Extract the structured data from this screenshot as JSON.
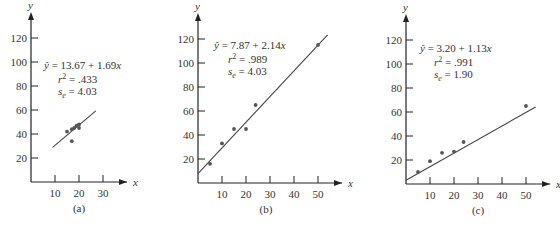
{
  "chart_data": [
    {
      "type": "scatter",
      "panel": "(a)",
      "xlabel": "x",
      "ylabel": "y",
      "xlim": [
        0,
        35
      ],
      "ylim": [
        0,
        130
      ],
      "x_ticks": [
        10,
        20,
        30
      ],
      "y_ticks": [
        20,
        40,
        60,
        80,
        100,
        120
      ],
      "grid": false,
      "points": [
        {
          "x": 15,
          "y": 42
        },
        {
          "x": 17,
          "y": 44
        },
        {
          "x": 18,
          "y": 45
        },
        {
          "x": 19,
          "y": 47
        },
        {
          "x": 20,
          "y": 48
        },
        {
          "x": 20,
          "y": 45
        },
        {
          "x": 17,
          "y": 34
        }
      ],
      "regression": {
        "intercept": 13.67,
        "slope": 1.69,
        "x_range": [
          9,
          27
        ]
      },
      "annotations": {
        "equation": "ŷ = 13.67 + 1.69x",
        "r2": "r² = .433",
        "se": "sₑ = 4.03"
      }
    },
    {
      "type": "scatter",
      "panel": "(b)",
      "xlabel": "x",
      "ylabel": "y",
      "xlim": [
        0,
        55
      ],
      "ylim": [
        0,
        130
      ],
      "x_ticks": [
        10,
        20,
        30,
        40,
        50
      ],
      "y_ticks": [
        20,
        40,
        60,
        80,
        100,
        120
      ],
      "grid": false,
      "points": [
        {
          "x": 5,
          "y": 16
        },
        {
          "x": 10,
          "y": 33
        },
        {
          "x": 15,
          "y": 45
        },
        {
          "x": 20,
          "y": 45
        },
        {
          "x": 24,
          "y": 65
        },
        {
          "x": 50,
          "y": 115
        }
      ],
      "regression": {
        "intercept": 7.87,
        "slope": 2.14,
        "x_range": [
          0,
          54
        ]
      },
      "annotations": {
        "equation": "ŷ = 7.87 + 2.14x",
        "r2": "r² = .989",
        "se": "sₑ = 4.03"
      }
    },
    {
      "type": "scatter",
      "panel": "(c)",
      "xlabel": "x",
      "ylabel": "y",
      "xlim": [
        0,
        55
      ],
      "ylim": [
        0,
        130
      ],
      "x_ticks": [
        10,
        20,
        30,
        40,
        50
      ],
      "y_ticks": [
        20,
        40,
        60,
        80,
        100,
        120
      ],
      "grid": false,
      "points": [
        {
          "x": 5,
          "y": 10
        },
        {
          "x": 10,
          "y": 19
        },
        {
          "x": 15,
          "y": 26
        },
        {
          "x": 20,
          "y": 27
        },
        {
          "x": 24,
          "y": 35
        },
        {
          "x": 50,
          "y": 65
        }
      ],
      "regression": {
        "intercept": 3.2,
        "slope": 1.13,
        "x_range": [
          0,
          54
        ]
      },
      "annotations": {
        "equation": "ŷ = 3.20 + 1.13x",
        "r2": "r² = .991",
        "se": "sₑ = 1.90"
      }
    }
  ],
  "panels": [
    {
      "caption": "(a)",
      "eq_lhs": "ŷ",
      "eq_rhs": " = 13.67 + 1.69",
      "eq_var": "x",
      "r2_label": "r",
      "r2_value": " = .433",
      "se_label": "s",
      "se_sub": "e",
      "se_value": " = 4.03"
    },
    {
      "caption": "(b)",
      "eq_lhs": "ŷ",
      "eq_rhs": " = 7.87 + 2.14",
      "eq_var": "x",
      "r2_label": "r",
      "r2_value": " = .989",
      "se_label": "s",
      "se_sub": "e",
      "se_value": " = 4.03"
    },
    {
      "caption": "(c)",
      "eq_lhs": "ŷ",
      "eq_rhs": " = 3.20 + 1.13",
      "eq_var": "x",
      "r2_label": "r",
      "r2_value": " = .991",
      "se_label": "s",
      "se_sub": "e",
      "se_value": " = 1.90"
    }
  ],
  "axis_labels": {
    "x": "x",
    "y": "y"
  },
  "colors": {
    "axis": "#222222",
    "line": "#444444",
    "point": "#555555"
  }
}
